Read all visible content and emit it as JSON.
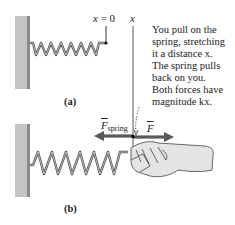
{
  "panel_a": {
    "label_x0": "x = 0",
    "label_x": "x",
    "caption": "(a)"
  },
  "panel_b": {
    "force_spring_label": "F",
    "force_spring_sub": "spring",
    "force_hand_label": "F",
    "caption": "(b)"
  },
  "annotation": {
    "lines": [
      "You pull on the",
      "spring, stretching",
      "it a distance x.",
      "The spring pulls",
      "back on you.",
      "Both forces have",
      "magnitude kx."
    ]
  },
  "colors": {
    "wall": "#bdbdbd",
    "spring": "#555555",
    "arrow": "#5a5a5a",
    "hand": "#e0e0e0"
  }
}
